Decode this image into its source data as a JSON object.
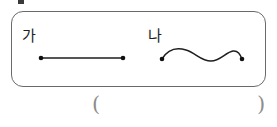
{
  "page": {
    "type": "worksheet-figure",
    "width": 277,
    "height": 127,
    "background": "#ffffff",
    "ink_color": "#1e1e1e",
    "box_border_color": "#6a6a6a",
    "paren_color": "#8d8d8d"
  },
  "figure": {
    "box_label": "figure-box",
    "items": [
      {
        "label": "가",
        "shape": "straight-line-segment",
        "endpoints_visible": 2,
        "endpoint_marker": "filled-dot",
        "x_start": 41,
        "x_end": 123,
        "y": 58
      },
      {
        "label": "나",
        "shape": "wavy-curved-line",
        "endpoints_visible": 2,
        "endpoint_marker": "filled-dot",
        "x_start": 162,
        "x_end": 242,
        "y": 59
      }
    ]
  },
  "answer": {
    "open_paren": "(",
    "close_paren": ")",
    "value": ""
  }
}
